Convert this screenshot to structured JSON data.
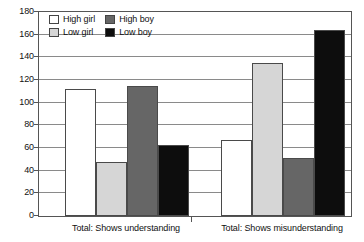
{
  "chart_data": {
    "type": "bar",
    "title": "",
    "subtitle": "",
    "xlabel": "",
    "ylabel": "",
    "ylim": [
      0,
      180
    ],
    "ytick_step": 20,
    "yticks": [
      180,
      160,
      140,
      120,
      100,
      80,
      60,
      40,
      20,
      0
    ],
    "grid": true,
    "legend_position": "top-left-inside",
    "categories": [
      "Total: Shows understanding",
      "Total: Shows misunderstanding"
    ],
    "series": [
      {
        "name": "High girl",
        "color": "#ffffff",
        "values": [
          112,
          67
        ]
      },
      {
        "name": "Low girl",
        "color": "#d6d6d6",
        "values": [
          48,
          135
        ]
      },
      {
        "name": "High boy",
        "color": "#666666",
        "values": [
          115,
          51
        ]
      },
      {
        "name": "Low boy",
        "color": "#0d0d0d",
        "values": [
          63,
          164
        ]
      }
    ]
  },
  "legend": {
    "entries": [
      {
        "label": "High girl",
        "swatch": "#ffffff"
      },
      {
        "label": "High boy",
        "swatch": "#666666"
      },
      {
        "label": "Low girl",
        "swatch": "#d6d6d6"
      },
      {
        "label": "Low boy",
        "swatch": "#0d0d0d"
      }
    ]
  },
  "axis": {
    "y_tick_labels": [
      "180",
      "160",
      "140",
      "120",
      "100",
      "80",
      "60",
      "40",
      "20",
      "0"
    ],
    "x_tick_labels": [
      "Total: Shows understanding",
      "Total: Shows misunderstanding"
    ]
  },
  "colors": {
    "frame": "#555555",
    "gridline": "#8a8a8a",
    "bar_outline": "#4a4a4a",
    "background": "#ffffff",
    "text": "#111111"
  }
}
